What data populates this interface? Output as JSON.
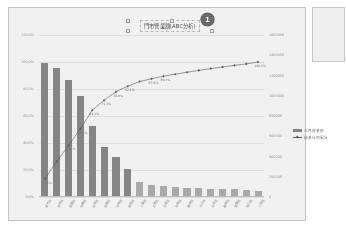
{
  "chart_data": {
    "type": "bar",
    "title": "門市營業額(ABC分析)",
    "subtitle": "",
    "xlabel": "",
    "ylabel": "",
    "legend_position": "right",
    "grid": true,
    "axes": {
      "left": {
        "label": "",
        "ticks": [
          "0.0%",
          "20.0%",
          "40.0%",
          "60.0%",
          "80.0%",
          "100.0%",
          "120.0%"
        ],
        "ylim": [
          0,
          120
        ]
      },
      "right": {
        "label": "",
        "ticks": [
          "0",
          "200000",
          "400000",
          "600000",
          "800000",
          "1000000",
          "1200000",
          "1400000",
          "1600000"
        ],
        "ylim": [
          0,
          1600000
        ]
      }
    },
    "categories": [
      "新竹店",
      "台中店",
      "桃園店",
      "板橋店",
      "台南店",
      "高雄店",
      "中壢店",
      "新莊店",
      "三重店",
      "土城店",
      "永和店",
      "中和店",
      "蘆洲店",
      "汐止店",
      "淡水店",
      "樹林店",
      "鶯歌店",
      "林口店",
      "八里店"
    ],
    "series": [
      {
        "name": "本月營業額",
        "type": "bar",
        "axis": "right",
        "values": [
          1320000,
          1270000,
          1155000,
          1000000,
          700000,
          490000,
          395000,
          280000,
          145000,
          120000,
          108000,
          100000,
          92000,
          88000,
          84000,
          80000,
          76000,
          72000,
          60000
        ]
      },
      {
        "name": "營業比例累計",
        "type": "line",
        "axis": "left",
        "values": [
          13.5,
          26.4,
          38.2,
          50.6,
          64.2,
          71.7,
          78.0,
          82.1,
          85.5,
          87.6,
          89.4,
          91.0,
          92.4,
          93.8,
          95.1,
          96.3,
          97.5,
          98.6,
          100.0
        ]
      }
    ],
    "point_labels": [
      {
        "index": 0,
        "text": "13.5%"
      },
      {
        "index": 2,
        "text": "38.2%"
      },
      {
        "index": 3,
        "text": "50.6%"
      },
      {
        "index": 4,
        "text": "64.2%"
      },
      {
        "index": 5,
        "text": "71.7%"
      },
      {
        "index": 6,
        "text": "78.0%"
      },
      {
        "index": 7,
        "text": "82.1%"
      },
      {
        "index": 9,
        "text": "87.6%"
      },
      {
        "index": 10,
        "text": "89.4%"
      },
      {
        "index": 18,
        "text": "100.0%"
      }
    ],
    "colors": {
      "bar_primary": "#7d7d7d",
      "bar_secondary": "#a8a8a8",
      "line": "#4a4a4a",
      "grid": "#e8e8e8",
      "badge": "#5a5a5a"
    }
  },
  "annotation": {
    "badge_number": "1"
  },
  "side_panel": {
    "content": ""
  }
}
